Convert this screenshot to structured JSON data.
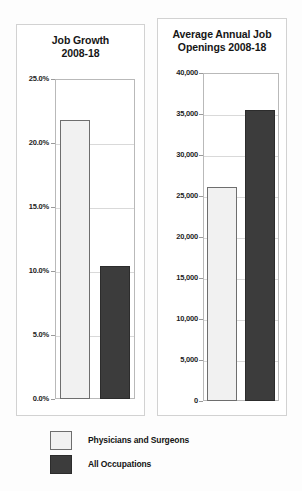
{
  "legend": {
    "items": [
      {
        "label": "Physicians and Surgeons",
        "swatch": "light",
        "color": "#f1f1f1"
      },
      {
        "label": "All Occupations",
        "swatch": "dark",
        "color": "#3c3c3c"
      }
    ]
  },
  "chart_data": [
    {
      "type": "bar",
      "id": "job-growth",
      "title": "Job Growth\n2008-18",
      "title_lines": [
        "Job Growth",
        "2008-18"
      ],
      "categories": [
        "Physicians and Surgeons",
        "All Occupations"
      ],
      "values": [
        21.8,
        10.4
      ],
      "value_labels": [
        "21.8%",
        "10.4%"
      ],
      "xlabel": "",
      "ylabel": "",
      "ylim": [
        0,
        25
      ],
      "ytick_labels": [
        "25.0%",
        "20.0%",
        "15.0%",
        "10.0%",
        "5.0%",
        "0.0%"
      ],
      "ytick_values": [
        25,
        20,
        15,
        10,
        5,
        0
      ],
      "grid": true,
      "legend_position": "bottom",
      "colors": [
        "#f1f1f1",
        "#3c3c3c"
      ]
    },
    {
      "type": "bar",
      "id": "job-openings",
      "title": "Average Annual Job\nOpenings 2008-18",
      "title_lines": [
        "Average Annual Job",
        "Openings 2008-18"
      ],
      "categories": [
        "Physicians and Surgeons",
        "All Occupations"
      ],
      "values": [
        26100,
        35500
      ],
      "value_labels": [
        "26,100",
        "35,500"
      ],
      "xlabel": "",
      "ylabel": "",
      "ylim": [
        0,
        40000
      ],
      "ytick_labels": [
        "40,000",
        "35,000",
        "30,000",
        "25,000",
        "20,000",
        "15,000",
        "10,000",
        "5,000",
        "0"
      ],
      "ytick_values": [
        40000,
        35000,
        30000,
        25000,
        20000,
        15000,
        10000,
        5000,
        0
      ],
      "grid": true,
      "legend_position": "bottom",
      "colors": [
        "#f1f1f1",
        "#3c3c3c"
      ]
    }
  ]
}
